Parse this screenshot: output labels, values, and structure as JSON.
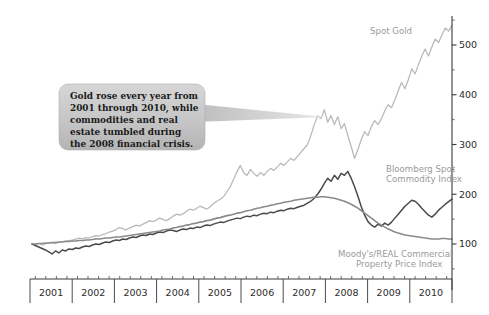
{
  "chart_data": {
    "type": "line",
    "title": "",
    "xlabel": "",
    "ylabel": "",
    "xlim": [
      2001,
      2011
    ],
    "ylim": [
      45,
      560
    ],
    "grid": false,
    "legend_position": "inline-right",
    "y_ticks_major": [
      100,
      200,
      300,
      400,
      500
    ],
    "y_ticks_minor": [
      50,
      150,
      250,
      350,
      450,
      550
    ],
    "x_tick_labels": [
      "2001",
      "2002",
      "2003",
      "2004",
      "2005",
      "2006",
      "2007",
      "2008",
      "2009",
      "2010"
    ],
    "note": "Indexed series, January 2001 = 100",
    "series": [
      {
        "name": "Spot Gold",
        "color": "#b8b8b8",
        "label_x": 2009.05,
        "label_y": 505,
        "values": [
          100,
          99,
          101,
          98,
          100,
          103,
          102,
          101,
          103,
          105,
          106,
          107,
          108,
          110,
          112,
          111,
          113,
          112,
          115,
          117,
          116,
          119,
          121,
          124,
          126,
          129,
          133,
          131,
          128,
          132,
          135,
          138,
          136,
          140,
          143,
          147,
          145,
          148,
          152,
          149,
          147,
          151,
          156,
          160,
          158,
          161,
          166,
          170,
          168,
          172,
          176,
          173,
          170,
          175,
          181,
          186,
          190,
          195,
          205,
          215,
          230,
          245,
          258,
          243,
          238,
          250,
          242,
          236,
          244,
          238,
          246,
          252,
          248,
          255,
          262,
          258,
          265,
          272,
          268,
          276,
          284,
          292,
          300,
          318,
          340,
          358,
          352,
          370,
          345,
          358,
          340,
          356,
          332,
          342,
          318,
          296,
          272,
          290,
          310,
          326,
          318,
          336,
          348,
          340,
          352,
          368,
          380,
          374,
          390,
          408,
          425,
          412,
          430,
          452,
          442,
          460,
          478,
          492,
          478,
          496,
          512,
          505,
          520,
          534,
          528,
          540
        ]
      },
      {
        "name": "Bloomberg Spot Commodity Index",
        "color": "#4a4a4a",
        "label_x": 2009.2,
        "label_y": 232,
        "label_line2_offset": 10,
        "values": [
          100,
          97,
          94,
          91,
          88,
          84,
          80,
          86,
          82,
          88,
          86,
          90,
          89,
          92,
          91,
          94,
          96,
          95,
          98,
          100,
          99,
          102,
          104,
          103,
          106,
          108,
          107,
          110,
          109,
          112,
          114,
          113,
          116,
          118,
          117,
          120,
          119,
          122,
          124,
          123,
          126,
          128,
          127,
          125,
          128,
          130,
          129,
          132,
          131,
          134,
          133,
          136,
          138,
          137,
          140,
          142,
          144,
          143,
          146,
          148,
          150,
          152,
          151,
          154,
          156,
          155,
          158,
          157,
          160,
          162,
          161,
          164,
          163,
          166,
          168,
          167,
          170,
          172,
          171,
          174,
          176,
          178,
          182,
          186,
          192,
          200,
          210,
          222,
          232,
          226,
          238,
          230,
          242,
          238,
          246,
          232,
          215,
          196,
          175,
          158,
          145,
          138,
          134,
          140,
          136,
          142,
          138,
          144,
          152,
          160,
          168,
          176,
          182,
          188,
          186,
          180,
          172,
          165,
          158,
          154,
          160,
          168,
          174,
          180,
          185,
          190
        ]
      },
      {
        "name": "Moody's/REAL Commercial Property Price Index",
        "color": "#8a8a8a",
        "label_x": 2008.7,
        "label_y": 88,
        "values": [
          100,
          100,
          101,
          101,
          102,
          102,
          103,
          103,
          104,
          104,
          105,
          105,
          106,
          106,
          107,
          107,
          108,
          108,
          109,
          110,
          110,
          111,
          112,
          112,
          113,
          114,
          114,
          115,
          116,
          117,
          118,
          119,
          120,
          121,
          122,
          123,
          124,
          125,
          126,
          128,
          129,
          130,
          132,
          133,
          135,
          136,
          138,
          139,
          141,
          142,
          144,
          145,
          147,
          148,
          150,
          152,
          153,
          155,
          157,
          158,
          160,
          162,
          163,
          165,
          167,
          168,
          170,
          172,
          173,
          175,
          176,
          178,
          179,
          181,
          182,
          184,
          185,
          186,
          188,
          189,
          190,
          191,
          192,
          193,
          194,
          194,
          195,
          195,
          194,
          193,
          192,
          190,
          188,
          186,
          183,
          180,
          176,
          172,
          167,
          162,
          157,
          152,
          147,
          142,
          138,
          134,
          130,
          127,
          124,
          122,
          120,
          118,
          117,
          116,
          115,
          114,
          113,
          112,
          111,
          110,
          110,
          110,
          111,
          111,
          110,
          110
        ]
      }
    ]
  },
  "callout": {
    "lines": [
      "Gold rose every year from",
      "2001 through 2010, while",
      "commodities and real",
      "estate tumbled during",
      "the 2008 financial crisis."
    ],
    "fill_color": "#c9c9c9",
    "points_to": "2007 gold peak"
  },
  "legend": {
    "spot_gold": "Spot Gold",
    "bloomberg_line1": "Bloomberg Spot",
    "bloomberg_line2": "Commodity Index",
    "moodys_line1": "Moody's/REAL Commercial",
    "moodys_line2": "Property Price Index"
  }
}
